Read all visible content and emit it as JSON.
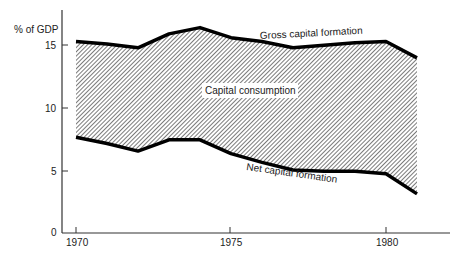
{
  "chart_data": {
    "type": "area",
    "title": "",
    "xlabel": "",
    "ylabel": "% of GDP",
    "x": [
      1970,
      1971,
      1972,
      1973,
      1974,
      1975,
      1976,
      1977,
      1978,
      1979,
      1980,
      1981
    ],
    "series": [
      {
        "name": "Gross capital formation",
        "values": [
          15.2,
          15.0,
          14.7,
          15.8,
          16.3,
          15.5,
          15.2,
          14.7,
          14.9,
          15.1,
          15.2,
          13.9
        ]
      },
      {
        "name": "Net capital formation",
        "values": [
          7.6,
          7.1,
          6.5,
          7.4,
          7.4,
          6.3,
          5.6,
          5.0,
          4.9,
          4.9,
          4.7,
          3.1
        ]
      }
    ],
    "shaded_region": {
      "label": "Capital consumption",
      "between": [
        "Gross capital formation",
        "Net capital formation"
      ],
      "pattern": "diagonal hatch"
    },
    "ylim": [
      0,
      18
    ],
    "xlim": [
      1970,
      1981
    ],
    "yticks": [
      0,
      5,
      10,
      15
    ],
    "xticks": [
      1970,
      1975,
      1980
    ],
    "grid": false,
    "legend": "inline labels"
  },
  "labels": {
    "ylabel": "% of GDP",
    "gross": "Gross capital formation",
    "net": "Net capital formation",
    "consumption": "Capital consumption",
    "y0": "0",
    "y5": "5",
    "y10": "10",
    "y15": "15",
    "x1970": "1970",
    "x1975": "1975",
    "x1980": "1980"
  }
}
